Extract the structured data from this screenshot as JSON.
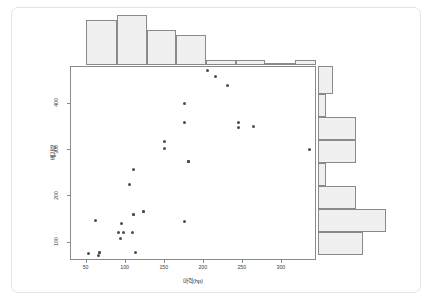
{
  "figure": {
    "background_color": "#ffffff",
    "card_border_color": "#e3e3e3",
    "axis_color": "#8a8a8a",
    "point_color": "#4d4d52",
    "bar_fill": "#f0f0f0",
    "bar_stroke": "#8a8a8a"
  },
  "chart_data": {
    "type": "scatter",
    "title": "",
    "subtitle": "",
    "xlabel": "마력(hp)",
    "ylabel": "배기량",
    "xlim": [
      30,
      345
    ],
    "ylim": [
      60,
      480
    ],
    "xticks": [
      50,
      100,
      150,
      200,
      250,
      300
    ],
    "yticks": [
      100,
      200,
      300,
      400
    ],
    "grid": false,
    "legend": false,
    "legend_position": "none",
    "x": [
      110,
      110,
      93,
      110,
      175,
      105,
      245,
      62,
      95,
      123,
      123,
      180,
      180,
      180,
      205,
      215,
      230,
      66,
      52,
      65,
      97,
      150,
      150,
      245,
      175,
      66,
      91,
      113,
      264,
      175,
      335,
      109
    ],
    "y": [
      160,
      160,
      108,
      258,
      360,
      225,
      360,
      147,
      141,
      168,
      168,
      276,
      276,
      276,
      472,
      460,
      440,
      78,
      76,
      72,
      121,
      318,
      304,
      350,
      400,
      79,
      121,
      79,
      351,
      145,
      301,
      121
    ],
    "point_count": 32,
    "marginal_top": {
      "type": "bar",
      "orientation": "vertical",
      "bin_edges": [
        50,
        90,
        128,
        166,
        204,
        242,
        280,
        318,
        345
      ],
      "bin_centers": [
        70,
        109,
        147,
        185,
        223,
        261,
        299,
        331
      ],
      "counts": [
        9,
        10,
        7,
        6,
        1,
        1,
        0,
        1
      ],
      "ylabel": "count",
      "ymax": 10
    },
    "marginal_right": {
      "type": "bar",
      "orientation": "horizontal",
      "bin_edges": [
        70,
        120,
        170,
        220,
        270,
        320,
        370,
        420,
        480
      ],
      "bin_centers": [
        95,
        145,
        195,
        245,
        295,
        345,
        395,
        450
      ],
      "counts": [
        6,
        9,
        5,
        1,
        5,
        5,
        1,
        2
      ],
      "xlabel": "count",
      "xmax": 9
    }
  },
  "axis": {
    "x_tick_labels": [
      "50",
      "100",
      "150",
      "200",
      "250",
      "300"
    ],
    "y_tick_labels": [
      "100",
      "200",
      "300",
      "400"
    ],
    "x_title": "마력(hp)",
    "y_title": "배기량"
  }
}
